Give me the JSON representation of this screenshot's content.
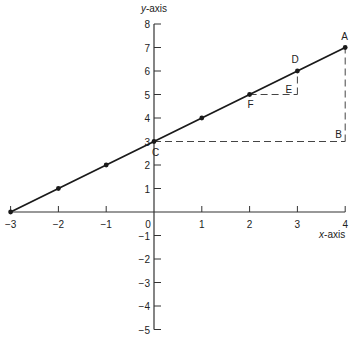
{
  "chart_data": {
    "type": "line",
    "title": "",
    "xlabel": "x-axis",
    "ylabel": "y-axis",
    "xlim": [
      -3,
      4
    ],
    "ylim": [
      -5,
      8
    ],
    "x_ticks": [
      -3,
      -2,
      -1,
      0,
      1,
      2,
      3,
      4
    ],
    "y_ticks": [
      -5,
      -4,
      -3,
      -2,
      -1,
      1,
      2,
      3,
      4,
      5,
      6,
      7,
      8
    ],
    "grid": false,
    "series": [
      {
        "name": "y = x + 3",
        "x": [
          -3,
          -2,
          -1,
          0,
          1,
          2,
          3,
          4
        ],
        "y": [
          0,
          1,
          2,
          3,
          4,
          5,
          6,
          7
        ]
      }
    ],
    "labeled_points": [
      {
        "label": "A",
        "x": 4,
        "y": 7
      },
      {
        "label": "B",
        "x": 4,
        "y": 3
      },
      {
        "label": "C",
        "x": 0,
        "y": 3
      },
      {
        "label": "D",
        "x": 3,
        "y": 6
      },
      {
        "label": "E",
        "x": 3,
        "y": 5
      },
      {
        "label": "F",
        "x": 2,
        "y": 5
      }
    ],
    "dashed_segments": [
      {
        "from": "C",
        "to": "B"
      },
      {
        "from": "B",
        "to": "A"
      },
      {
        "from": "F",
        "to": "E"
      },
      {
        "from": "E",
        "to": "D"
      }
    ]
  },
  "style": {
    "line_color": "#1a1a1a",
    "axis_color": "#333333",
    "dash_color": "#444444"
  }
}
